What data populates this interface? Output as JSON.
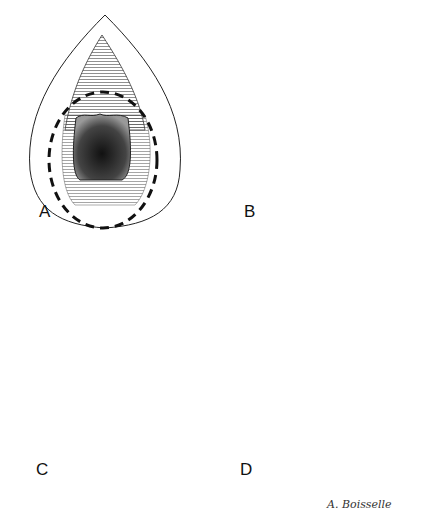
{
  "figure": {
    "panels": [
      {
        "id": "A",
        "label": "A",
        "description": "Incision outlines with dashed circumferential line"
      },
      {
        "id": "B",
        "label": "B",
        "description": "Excised area exposed"
      },
      {
        "id": "C",
        "label": "C",
        "description": "Retraction with instruments and directional arrows"
      },
      {
        "id": "D",
        "label": "D",
        "description": "Sutured closure"
      }
    ],
    "signature": "A. Boisselle"
  }
}
